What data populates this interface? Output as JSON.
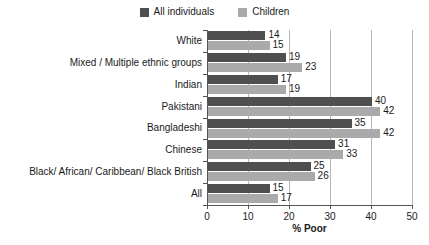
{
  "chart_data": {
    "type": "bar",
    "orientation": "horizontal",
    "title": "",
    "xlabel": "% Poor",
    "ylabel": "",
    "xlim": [
      0,
      50
    ],
    "xticks": [
      0,
      10,
      20,
      30,
      40,
      50
    ],
    "grid": "vertical",
    "legend_position": "top-center",
    "categories": [
      "White",
      "Mixed / Multiple ethnic groups",
      "Indian",
      "Pakistani",
      "Bangladeshi",
      "Chinese",
      "Black/ African/ Caribbean/ Black British",
      "All"
    ],
    "series": [
      {
        "name": "All individuals",
        "color": "#4f4f4f",
        "values": [
          14,
          19,
          17,
          40,
          35,
          31,
          25,
          15
        ]
      },
      {
        "name": "Children",
        "color": "#aaaaaa",
        "values": [
          15,
          23,
          19,
          42,
          42,
          33,
          26,
          17
        ]
      }
    ]
  },
  "colors": {
    "background": "#ffffff",
    "axis": "#555555",
    "grid": "#b6b6b6",
    "text": "#1a1a1a"
  }
}
